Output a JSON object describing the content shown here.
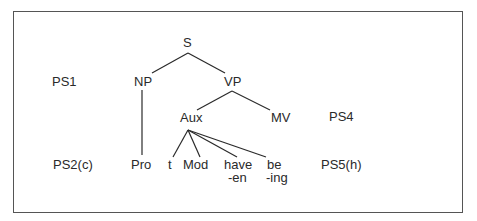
{
  "diagram": {
    "nodes": {
      "S": "S",
      "NP": "NP",
      "VP": "VP",
      "Aux": "Aux",
      "MV": "MV",
      "Pro": "Pro",
      "t": "t",
      "Mod": "Mod",
      "have": "have",
      "en": "-en",
      "be": "be",
      "ing": "-ing"
    },
    "rule_labels": {
      "ps1": "PS1",
      "ps2c": "PS2(c)",
      "ps4": "PS4",
      "ps5h": "PS5(h)"
    },
    "edges": [
      [
        "S",
        "NP"
      ],
      [
        "S",
        "VP"
      ],
      [
        "NP",
        "Pro"
      ],
      [
        "VP",
        "Aux"
      ],
      [
        "VP",
        "MV"
      ],
      [
        "Aux",
        "t"
      ],
      [
        "Aux",
        "Mod"
      ],
      [
        "Aux",
        "have-en"
      ],
      [
        "Aux",
        "be-ing"
      ]
    ],
    "colors": {
      "line": "#2a2a2a",
      "border": "#555555",
      "background": "#ffffff"
    }
  }
}
